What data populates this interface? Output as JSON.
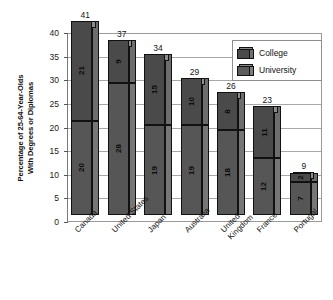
{
  "chart_data": {
    "type": "bar",
    "subtype": "stacked-3d-column",
    "title": "",
    "xlabel": "",
    "ylabel": "Percentage of 25-64-Year-Olds With Degrees or Diplomas",
    "ylabel_lines": [
      "Percentage of 25-64-Year-Olds",
      "With Degrees or Diplomas"
    ],
    "ylim": [
      0,
      40
    ],
    "yticks": [
      0,
      5,
      10,
      15,
      20,
      25,
      30,
      35,
      40
    ],
    "ytick_labels": [
      "0",
      "5",
      "10",
      "15",
      "20",
      "25",
      "30",
      "35",
      "40"
    ],
    "grid": true,
    "grid_axis": "y",
    "legend_position": "top-right",
    "categories": [
      "Canada",
      "United States",
      "Japan",
      "Australia",
      "United Kingdom",
      "France",
      "Portugal"
    ],
    "category_label_lines": [
      [
        "Canada"
      ],
      [
        "United States"
      ],
      [
        "Japan"
      ],
      [
        "Australia"
      ],
      [
        "United",
        "Kingdom"
      ],
      [
        "France"
      ],
      [
        "Portugal"
      ]
    ],
    "series": [
      {
        "name": "University",
        "stack_position": "bottom",
        "color": "#565656",
        "values": [
          20,
          28,
          19,
          19,
          18,
          12,
          7
        ]
      },
      {
        "name": "College",
        "stack_position": "top",
        "color": "#4a4a4a",
        "values": [
          21,
          9,
          15,
          10,
          8,
          11,
          2
        ]
      }
    ],
    "totals": [
      41,
      37,
      34,
      29,
      26,
      23,
      9
    ],
    "total_labels": [
      "41",
      "37",
      "34",
      "29",
      "26",
      "23",
      "9"
    ],
    "bars": [
      {
        "category": "Canada",
        "university": 20,
        "college": 21,
        "total": 41
      },
      {
        "category": "United States",
        "university": 28,
        "college": 9,
        "total": 37
      },
      {
        "category": "Japan",
        "university": 19,
        "college": 15,
        "total": 34
      },
      {
        "category": "Australia",
        "university": 19,
        "college": 10,
        "total": 29
      },
      {
        "category": "United Kingdom",
        "university": 18,
        "college": 8,
        "total": 26
      },
      {
        "category": "France",
        "university": 12,
        "college": 11,
        "total": 23
      },
      {
        "category": "Portugal",
        "university": 7,
        "college": 2,
        "total": 9
      }
    ]
  },
  "legend": {
    "items": [
      {
        "label": "College",
        "color": "#4a4a4a"
      },
      {
        "label": "University",
        "color": "#5c5c5c"
      }
    ]
  }
}
